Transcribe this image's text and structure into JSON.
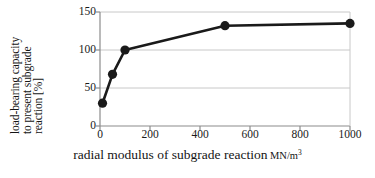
{
  "chart_data": {
    "type": "line",
    "title": "",
    "xlabel": "radial modulus of subgrade reaction",
    "xlabel_unit": "MN/m",
    "xlabel_unit_exp": "3",
    "ylabel_lines": [
      "load-bearing capacity",
      "to present subgrade",
      "reaction [%]"
    ],
    "ylabel": "load-bearing capacity to present subgrade reaction [%]",
    "x": [
      10,
      50,
      100,
      500,
      1000
    ],
    "values": [
      30,
      68,
      100,
      132,
      135
    ],
    "series": [
      {
        "name": "load-bearing capacity",
        "points": [
          {
            "x": 10,
            "y": 30
          },
          {
            "x": 50,
            "y": 68
          },
          {
            "x": 100,
            "y": 100
          },
          {
            "x": 500,
            "y": 132
          },
          {
            "x": 1000,
            "y": 135
          }
        ]
      }
    ],
    "xlim": [
      0,
      1000
    ],
    "ylim": [
      0,
      150
    ],
    "xticks": [
      0,
      200,
      400,
      600,
      800,
      1000
    ],
    "yticks": [
      0,
      50,
      100,
      150
    ],
    "xtick_labels": [
      "0",
      "200",
      "400",
      "600",
      "800",
      "1000"
    ],
    "ytick_labels": [
      "0",
      "50",
      "100",
      "150"
    ],
    "grid": "horizontal",
    "legend": "none",
    "line_color": "#1a1a1a",
    "marker_color": "#1a1a1a",
    "grid_color": "#c8c8c8",
    "axis_color": "#8c8c8c",
    "background": "#ffffff"
  }
}
